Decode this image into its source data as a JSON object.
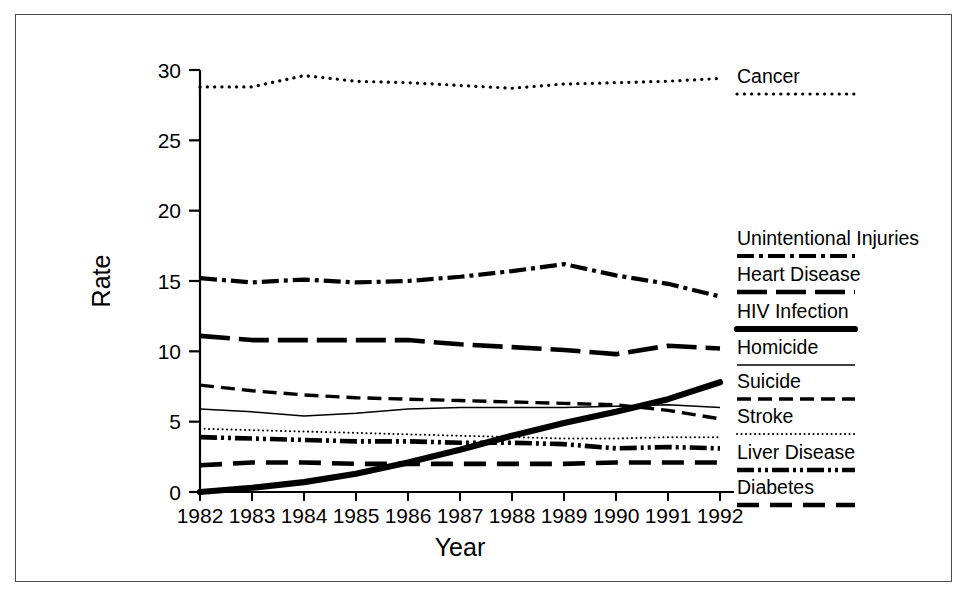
{
  "figure": {
    "border_color": "#4a4a4a",
    "background": "#ffffff",
    "line_color": "#000000"
  },
  "axes": {
    "x_title": "Year",
    "y_title": "Rate",
    "x_tick_labels": [
      "1982",
      "1983",
      "1984",
      "1985",
      "1986",
      "1987",
      "1988",
      "1989",
      "1990",
      "1991",
      "1992"
    ],
    "y_tick_labels": [
      "0",
      "5",
      "10",
      "15",
      "20",
      "25",
      "30"
    ]
  },
  "legend": {
    "entries": [
      {
        "label": "Cancer",
        "style": "dotted-coarse"
      },
      {
        "label": "Unintentional Injuries",
        "style": "dash-dot"
      },
      {
        "label": "Heart Disease",
        "style": "long-dash"
      },
      {
        "label": "HIV Infection",
        "style": "solid-thick"
      },
      {
        "label": "Homicide",
        "style": "solid-thin"
      },
      {
        "label": "Suicide",
        "style": "dash-medium"
      },
      {
        "label": "Stroke",
        "style": "dotted-fine"
      },
      {
        "label": "Liver Disease",
        "style": "dash-dot-dot"
      },
      {
        "label": "Diabetes",
        "style": "long-dash-thick"
      }
    ]
  },
  "chart_data": {
    "type": "line",
    "title": "",
    "xlabel": "Year",
    "ylabel": "Rate",
    "x": [
      1982,
      1983,
      1984,
      1985,
      1986,
      1987,
      1988,
      1989,
      1990,
      1991,
      1992
    ],
    "xlim": [
      1982,
      1992
    ],
    "ylim": [
      0,
      30
    ],
    "yticks": [
      0,
      5,
      10,
      15,
      20,
      25,
      30
    ],
    "grid": false,
    "legend_position": "right",
    "series": [
      {
        "name": "Cancer",
        "style": "dotted-coarse",
        "values": [
          28.8,
          28.8,
          29.6,
          29.2,
          29.1,
          28.9,
          28.7,
          29.0,
          29.1,
          29.2,
          29.4
        ]
      },
      {
        "name": "Unintentional Injuries",
        "style": "dash-dot",
        "values": [
          15.2,
          14.9,
          15.1,
          14.9,
          15.0,
          15.3,
          15.7,
          16.2,
          15.4,
          14.8,
          13.9
        ]
      },
      {
        "name": "Heart Disease",
        "style": "long-dash",
        "values": [
          11.1,
          10.8,
          10.8,
          10.8,
          10.8,
          10.5,
          10.3,
          10.1,
          9.8,
          10.4,
          10.2
        ]
      },
      {
        "name": "HIV Infection",
        "style": "solid-thick",
        "values": [
          0.0,
          0.3,
          0.7,
          1.3,
          2.1,
          3.0,
          4.0,
          4.9,
          5.7,
          6.6,
          7.8
        ]
      },
      {
        "name": "Homicide",
        "style": "solid-thin",
        "values": [
          5.9,
          5.7,
          5.4,
          5.6,
          5.9,
          6.0,
          6.0,
          6.0,
          6.1,
          6.2,
          6.0
        ]
      },
      {
        "name": "Suicide",
        "style": "dash-medium",
        "values": [
          7.6,
          7.2,
          6.9,
          6.7,
          6.6,
          6.5,
          6.4,
          6.3,
          6.2,
          5.8,
          5.2
        ]
      },
      {
        "name": "Stroke",
        "style": "dotted-fine",
        "values": [
          4.5,
          4.4,
          4.3,
          4.2,
          4.1,
          4.0,
          3.9,
          3.8,
          3.8,
          3.9,
          3.9
        ]
      },
      {
        "name": "Liver Disease",
        "style": "dash-dot-dot",
        "values": [
          3.9,
          3.8,
          3.7,
          3.6,
          3.6,
          3.5,
          3.5,
          3.4,
          3.1,
          3.2,
          3.1
        ]
      },
      {
        "name": "Diabetes",
        "style": "long-dash-thick",
        "values": [
          1.9,
          2.1,
          2.1,
          2.0,
          2.0,
          2.0,
          2.0,
          2.0,
          2.1,
          2.1,
          2.1
        ]
      }
    ]
  }
}
